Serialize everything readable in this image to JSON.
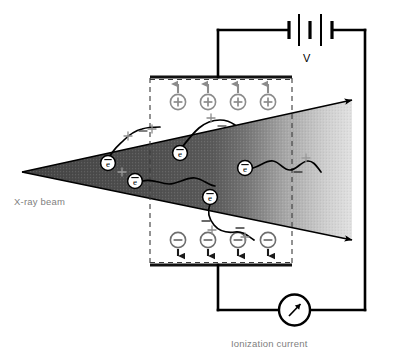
{
  "figure": {
    "background_color": "#ffffff"
  },
  "labels": {
    "xray_beam": "X-ray beam",
    "voltage": "V",
    "ionization_current": "Ionization current"
  },
  "colors": {
    "wire": "#000000",
    "plate": "#1a1a1a",
    "dashed_boundary": "#3a3a3a",
    "ion_gray": "#8c8c8c",
    "label_gray": "#808080",
    "beam_dark": "#4a4a4a",
    "beam_light": "#d8d8d8",
    "track": "#000000"
  },
  "beam": {
    "apex": {
      "x": 22,
      "y": 172
    },
    "upper_arrow_tip": {
      "x": 357,
      "y": 99
    },
    "lower_arrow_tip": {
      "x": 357,
      "y": 241
    },
    "fill": "gradient dark-to-light left-to-right",
    "texture": "stippled"
  },
  "chamber": {
    "top_plate": {
      "x1": 150,
      "x2": 292,
      "y": 78
    },
    "bottom_plate": {
      "x1": 150,
      "x2": 292,
      "y": 264
    },
    "left_dashed_x": 150,
    "right_dashed_x": 292,
    "top_dashed_y": 78,
    "bottom_dashed_y": 264
  },
  "ions": {
    "positive": {
      "symbol": "+",
      "count": 4,
      "row_y": 102,
      "xs": [
        178,
        208,
        238,
        268
      ],
      "arrow_direction": "up",
      "color": "#8c8c8c"
    },
    "negative": {
      "symbol": "−",
      "count": 4,
      "row_y": 240,
      "xs": [
        178,
        208,
        238,
        268
      ],
      "arrow_direction": "down",
      "color": "#8c8c8c"
    }
  },
  "electrons": {
    "symbol": "e",
    "overbar": true,
    "count": 5,
    "positions": [
      {
        "x": 108,
        "y": 163
      },
      {
        "x": 180,
        "y": 153
      },
      {
        "x": 135,
        "y": 181
      },
      {
        "x": 210,
        "y": 196
      },
      {
        "x": 245,
        "y": 168
      }
    ]
  },
  "ion_pair_marks": [
    {
      "x": 128,
      "y": 136,
      "sign": "+"
    },
    {
      "x": 152,
      "y": 129,
      "sign": "+"
    },
    {
      "x": 143,
      "y": 131,
      "sign": "−"
    },
    {
      "x": 211,
      "y": 118,
      "sign": "+"
    },
    {
      "x": 222,
      "y": 126,
      "sign": "−"
    },
    {
      "x": 306,
      "y": 158,
      "sign": "+"
    },
    {
      "x": 298,
      "y": 170,
      "sign": "−"
    },
    {
      "x": 206,
      "y": 222,
      "sign": "−"
    },
    {
      "x": 212,
      "y": 230,
      "sign": "+"
    },
    {
      "x": 240,
      "y": 228,
      "sign": "−"
    },
    {
      "x": 245,
      "y": 237,
      "sign": "+"
    }
  ],
  "battery": {
    "center_x": 310,
    "y": 30,
    "plates": 5,
    "plate_pattern": [
      "long",
      "short",
      "long",
      "short",
      "long"
    ],
    "left_wire_x": 218,
    "right_wire_x": 365
  },
  "meter": {
    "type": "ammeter",
    "center": {
      "x": 294,
      "y": 310
    },
    "radius": 15,
    "needle": "arrow pointing up-right"
  },
  "circuit": {
    "top_wire_y": 30,
    "bottom_wire_y": 310,
    "right_wire_x": 365,
    "top_branch_x": 218,
    "bottom_branch_x": 218
  }
}
